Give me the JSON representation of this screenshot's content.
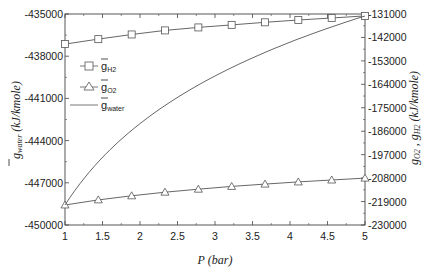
{
  "chart_data": {
    "type": "line",
    "title": "",
    "xlabel": "P (bar)",
    "ylabel_left": "g_water (kJ/kmole)",
    "ylabel_right": "g_O2 , g_H2 (kJ/kmole)",
    "xlim": [
      1,
      5
    ],
    "ylim_left": [
      -450000,
      -435000
    ],
    "ylim_right": [
      -230000,
      -131000
    ],
    "x_ticks": [
      "1",
      "1.5",
      "2",
      "2.5",
      "3",
      "3.5",
      "4",
      "4.5",
      "5"
    ],
    "y_ticks_left": [
      "-435000",
      "-438000",
      "-441000",
      "-444000",
      "-447000",
      "-450000"
    ],
    "y_ticks_right": [
      "-131000",
      "-142000",
      "-153000",
      "-164000",
      "-175000",
      "-186000",
      "-197000",
      "-208000",
      "-219000",
      "-230000"
    ],
    "grid": false,
    "legend_position": "upper-left inside",
    "legend": [
      {
        "label": "g",
        "sub": "H2",
        "marker": "square"
      },
      {
        "label": "g",
        "sub": "O2",
        "marker": "triangle"
      },
      {
        "label": "g",
        "sub": "water",
        "marker": "none"
      }
    ],
    "x": [
      1.0,
      1.444,
      1.889,
      2.333,
      2.778,
      3.222,
      3.667,
      4.111,
      4.556,
      5.0
    ],
    "series": [
      {
        "name": "g_H2",
        "axis": "right",
        "marker": "square",
        "values": [
          -145100,
          -142800,
          -140600,
          -138700,
          -137300,
          -136100,
          -134900,
          -133800,
          -132900,
          -131900
        ]
      },
      {
        "name": "g_O2",
        "axis": "right",
        "marker": "triangle",
        "values": [
          -220600,
          -218200,
          -216300,
          -214600,
          -213200,
          -211900,
          -210800,
          -209800,
          -208900,
          -208000
        ]
      },
      {
        "name": "g_water",
        "axis": "left",
        "marker": "none",
        "values": [
          -448580,
          -445200,
          -442800,
          -440900,
          -439400,
          -438200,
          -437200,
          -436400,
          -435700,
          -435140
        ]
      }
    ]
  },
  "axes": {
    "x_title": "P (bar)",
    "left_title_main": "g",
    "left_title_sub": "water",
    "left_title_units": " (kJ/kmole)",
    "right_title_o2": "g",
    "right_title_o2_sub": "O2",
    "right_title_sep": " , ",
    "right_title_h2": "g",
    "right_title_h2_sub": "H2",
    "right_title_units": " (kJ/kmole)"
  },
  "colors": {
    "line": "#555555",
    "frame": "#444444",
    "text": "#222222"
  }
}
